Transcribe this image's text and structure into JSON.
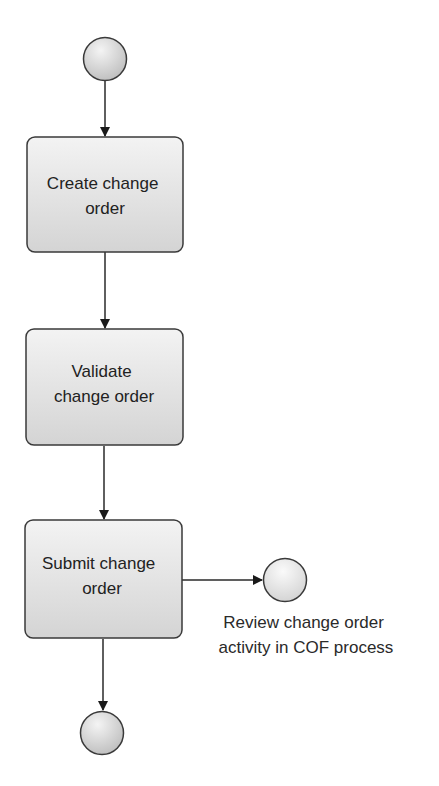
{
  "diagram": {
    "type": "process-flow",
    "colors": {
      "stroke": "#3a3a3a",
      "fill_light": "#f2f2f2",
      "fill_dark": "#c8c8c8",
      "text": "#222222"
    },
    "nodes": [
      {
        "id": "start",
        "kind": "start-event"
      },
      {
        "id": "create",
        "kind": "task",
        "lines": [
          "Create change",
          "order"
        ]
      },
      {
        "id": "validate",
        "kind": "task",
        "lines": [
          "Validate",
          "change order"
        ]
      },
      {
        "id": "submit",
        "kind": "task",
        "lines": [
          "Submit change",
          "order"
        ]
      },
      {
        "id": "review",
        "kind": "intermediate-event",
        "label_lines": [
          "Review change order",
          "activity in COF process"
        ]
      },
      {
        "id": "end",
        "kind": "end-event"
      }
    ],
    "edges": [
      {
        "from": "start",
        "to": "create"
      },
      {
        "from": "create",
        "to": "validate"
      },
      {
        "from": "validate",
        "to": "submit"
      },
      {
        "from": "submit",
        "to": "review"
      },
      {
        "from": "submit",
        "to": "end"
      }
    ]
  }
}
